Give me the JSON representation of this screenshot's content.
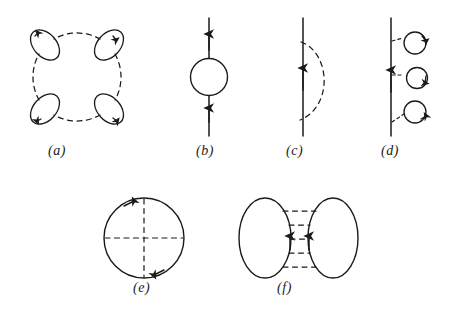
{
  "figure": {
    "background_color": "#ffffff",
    "line_color": "#1a1a1a",
    "width": 449,
    "height": 317
  },
  "panels": [
    {
      "id": "a",
      "label": "(a)",
      "name": "ring-diagram-with-four-bubbles",
      "description": "Large dashed circular ring interrupted by four small tilted solid electron-hole loops at the diagonal positions, each carrying an arrowhead.",
      "elements": {
        "ring_style": "dashed",
        "bubble_count": 4,
        "bubble_style": "solid",
        "arrowheads": 4
      }
    },
    {
      "id": "b",
      "label": "(b)",
      "name": "self-energy-bubble-on-line",
      "description": "Vertical solid propagator line with upward arrowheads above and below a solid circular bubble insertion at its centre.",
      "elements": {
        "line_style": "solid",
        "loop_style": "solid-circle",
        "arrowheads": 2,
        "arrow_direction": "up"
      }
    },
    {
      "id": "c",
      "label": "(c)",
      "name": "exchange-self-energy-diagram",
      "description": "Vertical solid propagator line with a single upward arrowhead at its centre and a dashed interaction arc bulging to the right that joins the line at two points.",
      "elements": {
        "line_style": "solid",
        "arc_style": "dashed",
        "arrowheads": 1,
        "arrow_direction": "up"
      }
    },
    {
      "id": "d",
      "label": "(d)",
      "name": "line-with-three-bubble-insertions",
      "description": "Vertical solid propagator line with one upward arrowhead, linked by short dashed interaction stubs to three small solid circular loops stacked to its right, each loop carrying an arrowhead.",
      "elements": {
        "line_style": "solid",
        "bubble_count": 3,
        "bubble_style": "solid-circle",
        "connector_style": "dashed",
        "arrowheads": 4
      }
    },
    {
      "id": "e",
      "label": "(e)",
      "name": "closed-loop-with-crossed-dashed-diameters",
      "description": "Solid closed circular particle loop with two arrowheads (upper-left and lower-right) crossed by a dashed vertical diameter and a dashed horizontal diameter.",
      "elements": {
        "loop_style": "solid-circle",
        "diameter_style": "dashed",
        "diameter_count": 2,
        "arrowheads": 2
      }
    },
    {
      "id": "f",
      "label": "(f)",
      "name": "two-loops-joined-by-dashed-interactions",
      "description": "Two tall solid ellipses facing each other, joined across the gap by five horizontal dashed interaction lines, with upward arrowheads on the facing inner edges of both ellipses.",
      "elements": {
        "loop_count": 2,
        "loop_style": "solid-ellipse",
        "interaction_style": "dashed",
        "interaction_count": 5,
        "arrowheads": 2,
        "arrow_direction": "up"
      }
    }
  ]
}
